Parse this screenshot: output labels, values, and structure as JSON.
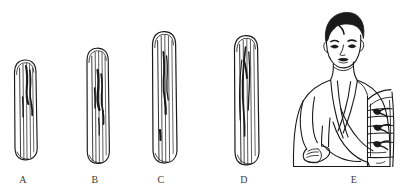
{
  "figure": {
    "background_color": "#ffffff",
    "ink_color": "#1a1a1a",
    "caption_color": "#3b3b3b",
    "panel_labels": [
      "A",
      "B",
      "C",
      "D",
      "E"
    ],
    "panels": [
      {
        "id": "A",
        "label": "A",
        "name": "splint-a",
        "type": "wooden-splint",
        "description": "shortest wooden splint board with rounded ends and vertical wood grain",
        "relative_length": "shortest"
      },
      {
        "id": "B",
        "label": "B",
        "name": "splint-b",
        "type": "wooden-splint",
        "description": "short-medium wooden splint board with rounded ends and vertical wood grain",
        "relative_length": "short-medium"
      },
      {
        "id": "C",
        "label": "C",
        "name": "splint-c",
        "type": "wooden-splint",
        "description": "long wooden splint board with rounded ends and vertical wood grain",
        "relative_length": "long"
      },
      {
        "id": "D",
        "label": "D",
        "name": "splint-d",
        "type": "wooden-splint",
        "description": "longest wooden splint board with rounded ends and vertical wood grain",
        "relative_length": "longest"
      },
      {
        "id": "E",
        "label": "E",
        "name": "patient-with-splinted-arm",
        "type": "patient-illustration",
        "description": "line drawing of a person with dark hair wearing a sling; the left forearm is immobilised with a splint tied with three bandage knots",
        "parts": [
          "head-with-dark-hair",
          "face",
          "torso",
          "sling-strap-over-shoulder",
          "supported-forearm",
          "hand",
          "splint-on-arm",
          "bandage-ties"
        ],
        "bandage_tie_count": 3
      }
    ]
  }
}
